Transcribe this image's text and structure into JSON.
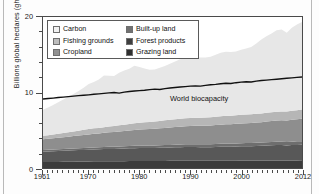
{
  "figure": {
    "background": "#fdfdfd",
    "frame_color": "#b9b9b9"
  },
  "chart_data": {
    "type": "area",
    "stacked": true,
    "title": "",
    "xlabel": "",
    "ylabel": "Billions global hectares (gha)",
    "xlim": [
      1961,
      2012
    ],
    "ylim": [
      0,
      20
    ],
    "xticks": [
      1961,
      1970,
      1980,
      1990,
      2000,
      2012
    ],
    "xtick_labels": [
      "1961",
      "1970",
      "1980",
      "1990",
      "2000",
      "2012"
    ],
    "yticks": [
      0,
      10,
      20
    ],
    "ytick_labels": [
      "0",
      "10",
      "20"
    ],
    "yticks_minor": [
      2,
      4,
      6,
      8,
      12,
      14,
      16,
      18
    ],
    "grid": false,
    "legend_position": "upper left",
    "x": [
      1961,
      1962,
      1963,
      1964,
      1965,
      1966,
      1967,
      1968,
      1969,
      1970,
      1971,
      1972,
      1973,
      1974,
      1975,
      1976,
      1977,
      1978,
      1979,
      1980,
      1981,
      1982,
      1983,
      1984,
      1985,
      1986,
      1987,
      1988,
      1989,
      1990,
      1991,
      1992,
      1993,
      1994,
      1995,
      1996,
      1997,
      1998,
      1999,
      2000,
      2001,
      2002,
      2003,
      2004,
      2005,
      2006,
      2007,
      2008,
      2009,
      2010,
      2011,
      2012
    ],
    "series": [
      {
        "name": "Grazing land",
        "color": "#3c3c3c",
        "values": [
          0.78,
          0.79,
          0.8,
          0.81,
          0.82,
          0.83,
          0.84,
          0.85,
          0.86,
          0.87,
          0.88,
          0.88,
          0.89,
          0.9,
          0.9,
          0.91,
          0.91,
          0.92,
          0.92,
          0.93,
          0.93,
          0.93,
          0.94,
          0.94,
          0.94,
          0.95,
          0.95,
          0.95,
          0.96,
          0.96,
          0.96,
          0.96,
          0.96,
          0.96,
          0.97,
          0.97,
          0.97,
          0.97,
          0.97,
          0.98,
          0.98,
          0.98,
          0.98,
          0.98,
          0.99,
          0.99,
          0.99,
          0.99,
          1.0,
          1.0,
          1.0,
          1.01
        ]
      },
      {
        "name": "Forest products",
        "color": "#585858",
        "values": [
          1.38,
          1.4,
          1.42,
          1.44,
          1.46,
          1.48,
          1.5,
          1.52,
          1.54,
          1.56,
          1.58,
          1.6,
          1.62,
          1.63,
          1.63,
          1.65,
          1.67,
          1.69,
          1.71,
          1.72,
          1.72,
          1.71,
          1.72,
          1.74,
          1.75,
          1.77,
          1.79,
          1.81,
          1.82,
          1.83,
          1.82,
          1.8,
          1.79,
          1.8,
          1.82,
          1.84,
          1.86,
          1.86,
          1.87,
          1.89,
          1.9,
          1.91,
          1.93,
          1.96,
          1.99,
          2.02,
          2.05,
          2.05,
          1.99,
          2.03,
          2.06,
          2.08
        ]
      },
      {
        "name": "Built-up land",
        "color": "#6e6e6e",
        "values": [
          0.22,
          0.22,
          0.23,
          0.23,
          0.24,
          0.24,
          0.25,
          0.25,
          0.26,
          0.26,
          0.27,
          0.27,
          0.28,
          0.28,
          0.29,
          0.29,
          0.3,
          0.3,
          0.31,
          0.31,
          0.32,
          0.32,
          0.33,
          0.33,
          0.34,
          0.34,
          0.35,
          0.35,
          0.36,
          0.36,
          0.37,
          0.37,
          0.38,
          0.38,
          0.39,
          0.39,
          0.4,
          0.4,
          0.41,
          0.41,
          0.42,
          0.42,
          0.43,
          0.43,
          0.44,
          0.44,
          0.45,
          0.45,
          0.46,
          0.46,
          0.47,
          0.47
        ]
      },
      {
        "name": "Cropland",
        "color": "#8e8e8e",
        "values": [
          1.42,
          1.45,
          1.48,
          1.52,
          1.56,
          1.6,
          1.64,
          1.68,
          1.72,
          1.76,
          1.8,
          1.83,
          1.87,
          1.91,
          1.95,
          1.99,
          2.02,
          2.06,
          2.1,
          2.13,
          2.16,
          2.19,
          2.22,
          2.25,
          2.28,
          2.31,
          2.34,
          2.36,
          2.39,
          2.41,
          2.43,
          2.45,
          2.47,
          2.49,
          2.52,
          2.54,
          2.56,
          2.58,
          2.6,
          2.62,
          2.64,
          2.66,
          2.68,
          2.7,
          2.73,
          2.76,
          2.79,
          2.82,
          2.85,
          2.89,
          2.93,
          2.97
        ]
      },
      {
        "name": "Fishing grounds",
        "color": "#b6b6b6",
        "values": [
          0.46,
          0.48,
          0.5,
          0.53,
          0.56,
          0.59,
          0.62,
          0.65,
          0.67,
          0.7,
          0.72,
          0.73,
          0.75,
          0.77,
          0.79,
          0.82,
          0.84,
          0.86,
          0.88,
          0.9,
          0.92,
          0.94,
          0.96,
          0.98,
          1.0,
          1.02,
          1.04,
          1.05,
          1.06,
          1.07,
          1.07,
          1.08,
          1.08,
          1.09,
          1.1,
          1.11,
          1.12,
          1.12,
          1.13,
          1.14,
          1.14,
          1.15,
          1.15,
          1.16,
          1.17,
          1.17,
          1.18,
          1.18,
          1.19,
          1.2,
          1.2,
          1.21
        ]
      },
      {
        "name": "Carbon",
        "color": "#e7e7e7",
        "values": [
          3.44,
          3.66,
          3.9,
          4.18,
          4.42,
          4.7,
          4.94,
          5.26,
          5.58,
          5.96,
          6.15,
          6.42,
          6.84,
          6.72,
          6.62,
          6.95,
          7.16,
          7.32,
          7.62,
          7.39,
          7.12,
          6.93,
          6.86,
          7.03,
          7.2,
          7.42,
          7.63,
          7.9,
          8.02,
          8.08,
          8.04,
          7.96,
          7.95,
          8.02,
          8.2,
          8.41,
          8.48,
          8.42,
          8.44,
          8.62,
          8.74,
          8.91,
          9.33,
          9.78,
          10.12,
          10.45,
          10.79,
          10.84,
          10.44,
          11.01,
          11.36,
          11.6
        ]
      }
    ],
    "reference_line": {
      "name": "World biocapacity",
      "label": "World biocapacity",
      "color": "#111111",
      "values": [
        9.14,
        9.2,
        9.26,
        9.33,
        9.39,
        9.46,
        9.52,
        9.58,
        9.63,
        9.69,
        9.76,
        9.82,
        9.88,
        9.95,
        10.0,
        9.92,
        10.05,
        10.14,
        10.2,
        10.25,
        10.3,
        10.38,
        10.45,
        10.4,
        10.52,
        10.6,
        10.66,
        10.72,
        10.78,
        10.84,
        10.88,
        10.85,
        10.95,
        11.02,
        11.08,
        11.16,
        11.22,
        11.2,
        11.3,
        11.38,
        11.42,
        11.4,
        11.5,
        11.58,
        11.64,
        11.7,
        11.76,
        11.82,
        11.88,
        11.94,
        12.0,
        12.05
      ]
    }
  },
  "legend": {
    "items": [
      {
        "label": "Carbon",
        "color": "#f2f2f2"
      },
      {
        "label": "Fishing grounds",
        "color": "#bdbdbd"
      },
      {
        "label": "Cropland",
        "color": "#919191"
      },
      {
        "label": "Built-up land",
        "color": "#717171"
      },
      {
        "label": "Forest products",
        "color": "#3f3f3f"
      },
      {
        "label": "Grazing land",
        "color": "#2f2f2f"
      }
    ]
  }
}
